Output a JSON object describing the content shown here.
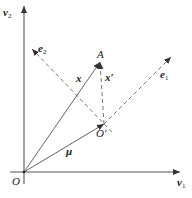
{
  "diagram": {
    "type": "vector-coordinate-diagram",
    "labels": {
      "v1": "v",
      "v1_sub": "1",
      "v2": "v",
      "v2_sub": "2",
      "e1": "e",
      "e1_sub": "1",
      "e2": "e",
      "e2_sub": "2",
      "A": "A",
      "x": "x",
      "x_prime": "x′",
      "mu": "μ",
      "O": "O",
      "O_prime": "O′"
    },
    "points": {
      "O": [
        24,
        172
      ],
      "O_prime": [
        104,
        124
      ],
      "A": [
        100,
        62
      ],
      "v1_end": [
        180,
        172
      ],
      "v2_end": [
        24,
        6
      ],
      "e1_end": [
        171,
        57
      ],
      "e2_end": [
        32,
        49
      ]
    },
    "colors": {
      "axis": "#555555",
      "line": "#666666",
      "text": "#222222"
    }
  }
}
